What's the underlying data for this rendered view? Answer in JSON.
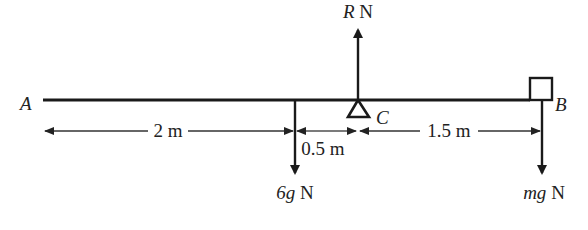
{
  "diagram": {
    "type": "beam-force-diagram",
    "points": {
      "A": "A",
      "B": "B",
      "C": "C"
    },
    "forces": {
      "reaction": {
        "symbol": "R",
        "unit": "N",
        "direction": "up",
        "at": "C"
      },
      "weight_beam": {
        "symbol": "6g",
        "unit": "N",
        "direction": "down"
      },
      "weight_particle": {
        "symbol": "mg",
        "unit": "N",
        "direction": "down",
        "at": "B"
      }
    },
    "dimensions": {
      "a_to_weight": "2 m",
      "weight_to_c": "0.5 m",
      "c_to_b": "1.5 m"
    },
    "distances_m": {
      "a_to_weight": 2,
      "weight_to_c": 0.5,
      "c_to_b": 1.5
    },
    "support": "triangular pivot at C",
    "particle": "square block at B"
  }
}
